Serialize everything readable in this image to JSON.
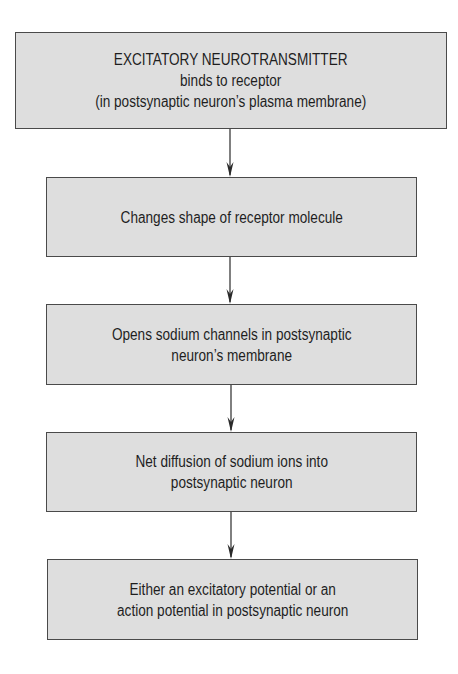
{
  "diagram": {
    "type": "flowchart",
    "direction": "top-to-bottom",
    "colors": {
      "background": "#ffffff",
      "box_fill": "#dedede",
      "box_border": "#4a4a4a",
      "text": "#1e1e1e",
      "arrow": "#2a2a2a"
    },
    "nodes": [
      {
        "id": "step-1",
        "lines": [
          "EXCITATORY NEUROTRANSMITTER",
          "binds to receptor",
          "(in postsynaptic neuron’s plasma membrane)"
        ]
      },
      {
        "id": "step-2",
        "lines": [
          "Changes shape of receptor molecule"
        ]
      },
      {
        "id": "step-3",
        "lines": [
          "Opens sodium channels in postsynaptic",
          "neuron’s membrane"
        ]
      },
      {
        "id": "step-4",
        "lines": [
          "Net diffusion of sodium ions into",
          "postsynaptic neuron"
        ]
      },
      {
        "id": "step-5",
        "lines": [
          "Either an excitatory potential or an",
          "action potential in postsynaptic neuron"
        ]
      }
    ],
    "edges": [
      {
        "from": "step-1",
        "to": "step-2"
      },
      {
        "from": "step-2",
        "to": "step-3"
      },
      {
        "from": "step-3",
        "to": "step-4"
      },
      {
        "from": "step-4",
        "to": "step-5"
      }
    ]
  }
}
